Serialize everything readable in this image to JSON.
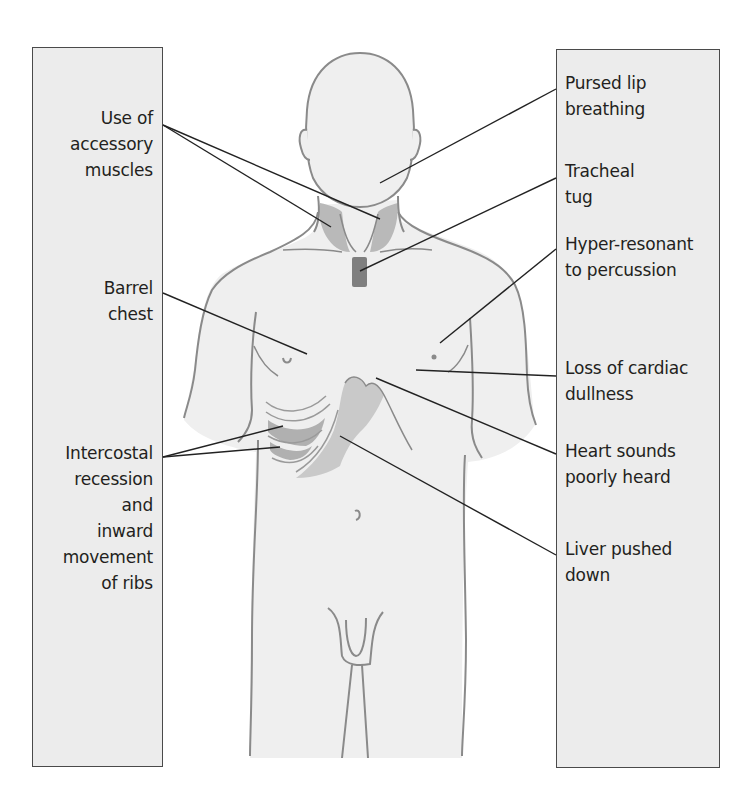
{
  "figure": {
    "colors": {
      "box_fill": "#ececec",
      "box_border": "#4a4a4a",
      "body_fill": "#efefef",
      "body_outline": "#8a8a8a",
      "muscle_shade": "#b9b9b9",
      "trachea_shade": "#7f7f7f",
      "leader_line": "#222222",
      "text": "#231f20"
    }
  },
  "left_labels": [
    {
      "id": "accessory-muscles",
      "lines": [
        "Use of",
        "accessory",
        "muscles"
      ]
    },
    {
      "id": "barrel-chest",
      "lines": [
        "Barrel",
        "chest"
      ]
    },
    {
      "id": "intercostal-recession",
      "lines": [
        "Intercostal",
        "recession",
        "and",
        "inward",
        "movement",
        "of ribs"
      ]
    }
  ],
  "right_labels": [
    {
      "id": "pursed-lip",
      "lines": [
        "Pursed lip",
        "breathing"
      ]
    },
    {
      "id": "tracheal-tug",
      "lines": [
        "Tracheal",
        "tug"
      ]
    },
    {
      "id": "hyper-resonant",
      "lines": [
        "Hyper-resonant",
        "to percussion"
      ]
    },
    {
      "id": "cardiac-dullness",
      "lines": [
        "Loss of cardiac",
        "dullness"
      ]
    },
    {
      "id": "heart-sounds",
      "lines": [
        "Heart sounds",
        "poorly heard"
      ]
    },
    {
      "id": "liver-pushed",
      "lines": [
        "Liver pushed",
        "down"
      ]
    }
  ]
}
